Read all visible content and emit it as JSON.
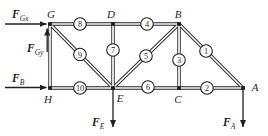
{
  "diagram": {
    "type": "truss-free-body-diagram",
    "colors": {
      "background": "#ffffff",
      "ink": "#1f1f1f",
      "badge_fill": "#ffffff"
    },
    "nodes": [
      {
        "id": "G",
        "label": "G",
        "x": 50,
        "y": 24,
        "lx": 51,
        "ly": 18
      },
      {
        "id": "D",
        "label": "D",
        "x": 113,
        "y": 24,
        "lx": 111,
        "ly": 18
      },
      {
        "id": "B",
        "label": "B",
        "x": 179,
        "y": 24,
        "lx": 178,
        "ly": 18
      },
      {
        "id": "H",
        "label": "H",
        "x": 50,
        "y": 88,
        "lx": 48,
        "ly": 103
      },
      {
        "id": "E",
        "label": "E",
        "x": 113,
        "y": 88,
        "lx": 120,
        "ly": 102
      },
      {
        "id": "C",
        "label": "C",
        "x": 179,
        "y": 88,
        "lx": 178,
        "ly": 103
      },
      {
        "id": "A",
        "label": "A",
        "x": 243,
        "y": 88,
        "lx": 255,
        "ly": 91
      }
    ],
    "members": [
      {
        "from": "G",
        "to": "H",
        "number": "",
        "bx": 0,
        "by": 0
      },
      {
        "from": "G",
        "to": "D",
        "number": "8",
        "bx": 80,
        "by": 24
      },
      {
        "from": "D",
        "to": "B",
        "number": "4",
        "bx": 147,
        "by": 24
      },
      {
        "from": "D",
        "to": "E",
        "number": "7",
        "bx": 113,
        "by": 50
      },
      {
        "from": "B",
        "to": "C",
        "number": "3",
        "bx": 179,
        "by": 60
      },
      {
        "from": "G",
        "to": "E",
        "number": "9",
        "bx": 80,
        "by": 54.5
      },
      {
        "from": "E",
        "to": "B",
        "number": "5",
        "bx": 146,
        "by": 56
      },
      {
        "from": "B",
        "to": "A",
        "number": "1",
        "bx": 206,
        "by": 51
      },
      {
        "from": "H",
        "to": "E",
        "number": "10",
        "bx": 80,
        "by": 88
      },
      {
        "from": "E",
        "to": "C",
        "number": "6",
        "bx": 148,
        "by": 87
      },
      {
        "from": "C",
        "to": "A",
        "number": "2",
        "bx": 207,
        "by": 88
      }
    ],
    "forces": [
      {
        "name": "FGx",
        "main": "F",
        "sub": "Gx",
        "direction": "right",
        "x1": 5,
        "y1": 24,
        "x2": 46.5,
        "y2": 24,
        "lx": 12,
        "ly": 18
      },
      {
        "name": "FGy",
        "main": "F",
        "sub": "Gy",
        "direction": "up",
        "x1": 47.2,
        "y1": 52,
        "x2": 47.2,
        "y2": 28.5,
        "lx": 27,
        "ly": 52
      },
      {
        "name": "FB",
        "main": "F",
        "sub": "B",
        "direction": "right",
        "x1": 5,
        "y1": 87.5,
        "x2": 46.5,
        "y2": 87.5,
        "lx": 12,
        "ly": 82
      },
      {
        "name": "FE",
        "main": "F",
        "sub": "E",
        "direction": "down",
        "x1": 113,
        "y1": 90,
        "x2": 113,
        "y2": 127,
        "lx": 92,
        "ly": 126
      },
      {
        "name": "FA",
        "main": "F",
        "sub": "A",
        "direction": "down",
        "x1": 243,
        "y1": 90,
        "x2": 243,
        "y2": 127,
        "lx": 223,
        "ly": 126
      }
    ]
  }
}
